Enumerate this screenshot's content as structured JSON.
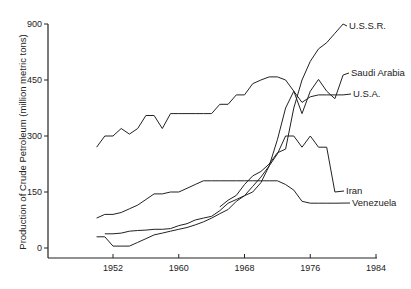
{
  "chart_data": {
    "type": "line",
    "title": "",
    "xlabel": "",
    "ylabel": "Production of Crude Petroleum (million metric tons)",
    "x_ticks": [
      1952,
      1960,
      1968,
      1976,
      1984
    ],
    "y_ticks": [
      0,
      150,
      300,
      450,
      900
    ],
    "xlim": [
      1950,
      1984
    ],
    "ylim": [
      0,
      900
    ],
    "grid": false,
    "legend_position": "inline labels at line ends",
    "series": [
      {
        "name": "U.S.S.R.",
        "x": [
          1965,
          1966,
          1967,
          1968,
          1969,
          1970,
          1971,
          1972,
          1973,
          1974,
          1975,
          1976,
          1977,
          1978,
          1979,
          1980
        ],
        "values": [
          110,
          128,
          141,
          170,
          193,
          205,
          225,
          255,
          265,
          375,
          450,
          600,
          700,
          750,
          825,
          900
        ]
      },
      {
        "name": "Saudi Arabia",
        "x": [
          1951,
          1952,
          1953,
          1954,
          1955,
          1956,
          1957,
          1958,
          1959,
          1960,
          1961,
          1962,
          1963,
          1964,
          1965,
          1966,
          1967,
          1968,
          1969,
          1970,
          1971,
          1972,
          1973,
          1974,
          1975,
          1976,
          1977,
          1978,
          1979,
          1980
        ],
        "values": [
          38,
          38,
          40,
          45,
          47,
          48,
          50,
          50,
          52,
          60,
          65,
          75,
          80,
          85,
          100,
          120,
          130,
          140,
          150,
          175,
          220,
          290,
          375,
          420,
          360,
          420,
          455,
          420,
          400,
          490
        ]
      },
      {
        "name": "U.S.A.",
        "x": [
          1950,
          1951,
          1952,
          1953,
          1954,
          1955,
          1956,
          1957,
          1958,
          1959,
          1960,
          1961,
          1962,
          1963,
          1964,
          1965,
          1966,
          1967,
          1968,
          1969,
          1970,
          1971,
          1972,
          1973,
          1974,
          1975,
          1976,
          1977,
          1978,
          1979,
          1980
        ],
        "values": [
          270,
          300,
          300,
          320,
          305,
          320,
          355,
          355,
          320,
          360,
          360,
          360,
          360,
          360,
          360,
          385,
          385,
          410,
          410,
          440,
          450,
          475,
          475,
          450,
          420,
          390,
          405,
          410,
          410,
          410,
          410
        ]
      },
      {
        "name": "Iran",
        "x": [
          1950,
          1951,
          1952,
          1953,
          1954,
          1955,
          1956,
          1957,
          1958,
          1959,
          1960,
          1961,
          1962,
          1963,
          1964,
          1965,
          1966,
          1967,
          1968,
          1969,
          1970,
          1971,
          1972,
          1973,
          1974,
          1975,
          1976,
          1977,
          1978,
          1979
        ],
        "values": [
          30,
          30,
          5,
          5,
          5,
          15,
          25,
          35,
          40,
          45,
          50,
          55,
          62,
          70,
          80,
          92,
          103,
          125,
          140,
          165,
          190,
          220,
          252,
          300,
          300,
          270,
          300,
          270,
          270,
          150
        ]
      },
      {
        "name": "Venezuela",
        "x": [
          1950,
          1951,
          1952,
          1953,
          1954,
          1955,
          1956,
          1957,
          1958,
          1959,
          1960,
          1961,
          1962,
          1963,
          1964,
          1965,
          1966,
          1967,
          1968,
          1969,
          1970,
          1971,
          1972,
          1973,
          1974,
          1975,
          1976,
          1977,
          1978,
          1979
        ],
        "values": [
          80,
          90,
          90,
          95,
          105,
          115,
          130,
          145,
          145,
          150,
          150,
          160,
          170,
          180,
          180,
          180,
          180,
          180,
          180,
          180,
          180,
          180,
          180,
          170,
          155,
          125,
          120,
          120,
          120,
          120
        ]
      }
    ]
  }
}
